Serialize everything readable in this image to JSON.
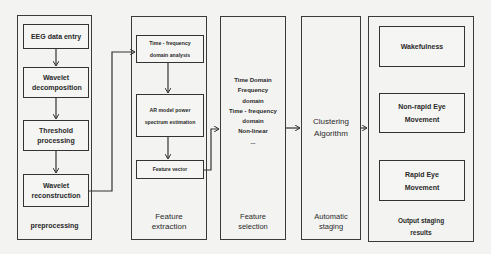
{
  "diagram": {
    "stages": {
      "preprocessing": {
        "label": "preprocessing",
        "steps": [
          "EEG data entry",
          "Wavelet decomposition",
          "Threshold processing",
          "Wavelet reconstruction"
        ]
      },
      "feature_extraction": {
        "label_line1": "Feature",
        "label_line2": "extraction",
        "steps": [
          "Time - frequency domain analysis",
          "AR model power spectrum estimation",
          "Feature vector"
        ]
      },
      "feature_selection": {
        "label_line1": "Feature",
        "label_line2": "selection",
        "items": [
          "Time Domain",
          "Frequency",
          "domain",
          "Time - frequency",
          "domain",
          "Non-linear",
          "..."
        ]
      },
      "automatic_staging": {
        "label_line1": "Automatic",
        "label_line2": "staging",
        "method_line1": "Clustering",
        "method_line2": "Algorithm"
      },
      "output": {
        "label_line1": "Output staging",
        "label_line2": "results",
        "results": [
          "Wakefulness",
          "Non-rapid Eye Movement",
          "Rapid Eye Movement"
        ]
      }
    },
    "colors": {
      "background": "#f3f3f1",
      "stroke": "#3a3a3a",
      "text": "#2a2a2a"
    }
  }
}
